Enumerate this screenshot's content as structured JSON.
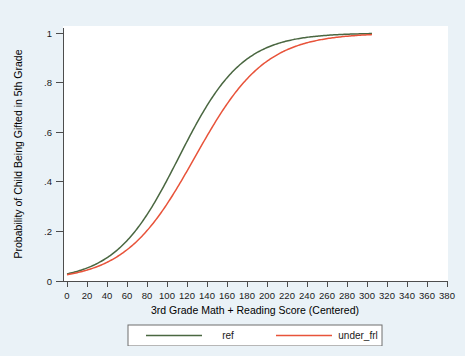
{
  "figure": {
    "background_color": "#eaf2f7",
    "plot_background_color": "#ffffff",
    "axis_color": "#4d4d4d"
  },
  "chart_data": {
    "type": "line",
    "title": "",
    "xlabel": "3rd Grade Math + Reading Score (Centered)",
    "ylabel": "Probability of Child Being Gifted in 5th Grade",
    "xlim": [
      0,
      380
    ],
    "ylim": [
      0,
      1
    ],
    "xticks": [
      0,
      20,
      40,
      60,
      80,
      100,
      120,
      140,
      160,
      180,
      200,
      220,
      240,
      260,
      280,
      300,
      320,
      340,
      360,
      380
    ],
    "xticklabels": [
      "0",
      "20",
      "40",
      "60",
      "80",
      "100",
      "120",
      "140",
      "160",
      "180",
      "200",
      "220",
      "240",
      "260",
      "280",
      "300",
      "320",
      "340",
      "360",
      "380"
    ],
    "yticks": [
      0,
      0.2,
      0.4,
      0.6,
      0.8,
      1
    ],
    "yticklabels": [
      "0",
      ".2",
      ".4",
      ".6",
      ".8",
      "1"
    ],
    "grid": false,
    "legend_position": "below-center",
    "x": [
      0,
      10,
      20,
      30,
      40,
      50,
      60,
      70,
      80,
      90,
      100,
      110,
      120,
      130,
      140,
      150,
      160,
      170,
      180,
      190,
      200,
      210,
      220,
      230,
      240,
      250,
      260,
      270,
      280,
      290,
      300,
      305
    ],
    "series": [
      {
        "name": "ref",
        "color": "#4a6741",
        "midpoint": 112,
        "slope": 0.0315,
        "values": [
          0.029,
          0.039,
          0.053,
          0.072,
          0.096,
          0.128,
          0.168,
          0.218,
          0.278,
          0.347,
          0.423,
          0.502,
          0.58,
          0.654,
          0.72,
          0.777,
          0.825,
          0.864,
          0.895,
          0.92,
          0.939,
          0.954,
          0.965,
          0.974,
          0.98,
          0.985,
          0.989,
          0.992,
          0.994,
          0.995,
          0.996,
          0.997
        ]
      },
      {
        "name": "under_frl",
        "color": "#e8533a",
        "midpoint": 128,
        "slope": 0.0285,
        "values": [
          0.026,
          0.034,
          0.045,
          0.059,
          0.078,
          0.101,
          0.131,
          0.168,
          0.213,
          0.267,
          0.328,
          0.396,
          0.466,
          0.537,
          0.605,
          0.668,
          0.724,
          0.773,
          0.814,
          0.849,
          0.877,
          0.901,
          0.92,
          0.936,
          0.949,
          0.959,
          0.967,
          0.974,
          0.979,
          0.983,
          0.987,
          0.988
        ]
      }
    ]
  },
  "legend": {
    "items": [
      {
        "label": "ref",
        "color": "#4a6741"
      },
      {
        "label": "under_frl",
        "color": "#e8533a"
      }
    ]
  }
}
